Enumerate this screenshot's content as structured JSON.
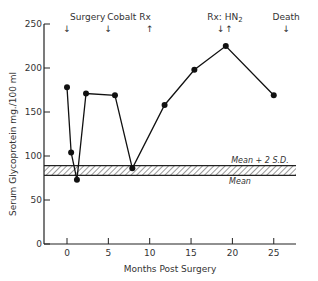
{
  "chart_data": {
    "type": "line",
    "title": "",
    "xlabel": "Months Post Surgery",
    "ylabel": "Serum Glycoprotein  mg./100 ml",
    "xlim": [
      -3,
      27
    ],
    "ylim": [
      0,
      250
    ],
    "xticks": [
      0,
      5,
      10,
      15,
      20,
      25
    ],
    "yticks": [
      0,
      50,
      100,
      150,
      200,
      250
    ],
    "grid": false,
    "series": [
      {
        "name": "Serum Glycoprotein",
        "x": [
          0,
          0.5,
          1.2,
          2.3,
          5.8,
          7.9,
          11.8,
          15.4,
          19.2,
          25
        ],
        "y": [
          178,
          104,
          73,
          171,
          169,
          86,
          158,
          198,
          225,
          169
        ]
      }
    ],
    "reference_band": {
      "lower": 78,
      "upper": 89,
      "lower_label": "Mean",
      "upper_label": "Mean + 2 S.D."
    },
    "annotations": [
      {
        "text": "Surgery",
        "x": 0,
        "arrow": "down"
      },
      {
        "text": "Cobalt Rx",
        "x_start": 5,
        "x_end": 10,
        "arrow_start": "down",
        "arrow_end": "up"
      },
      {
        "text": "Rx: HN2",
        "x_start": 18.6,
        "x_end": 19.5,
        "arrow_start": "down",
        "arrow_end": "up"
      },
      {
        "text": "Death",
        "x": 26.5,
        "arrow": "down"
      }
    ]
  },
  "labels": {
    "xlabel": "Months Post Surgery",
    "ylabel": "Serum Glycoprotein  mg./100 ml",
    "mean": "Mean",
    "mean_2sd": "Mean + 2 S.D.",
    "surgery": "Surgery",
    "cobalt": "Cobalt Rx",
    "rx": "Rx: HN",
    "rx_sub": "2",
    "death": "Death",
    "arrow_down": "↓",
    "arrow_up": "↑"
  }
}
